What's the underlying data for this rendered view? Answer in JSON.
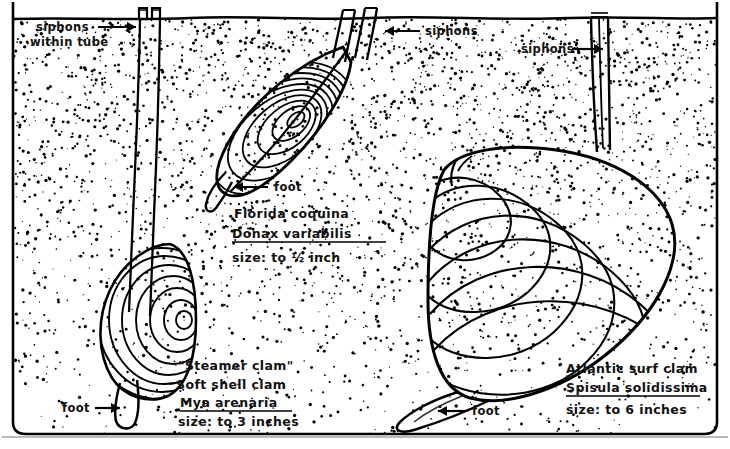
{
  "illustration": {
    "title": "Burrowing clams in sand — cross section",
    "medium": "pen-and-ink line drawing with stipple shading",
    "ink_color": "#000000",
    "background_color": "#ffffff"
  },
  "scene": {
    "sand_surface_label": "sand surface / water line",
    "sand_texture": "stipple dots, dense near surface, sparser at depth",
    "frame": "hand-drawn rounded rectangle border"
  },
  "annotations": [
    {
      "id": "siphons-within-tube",
      "text_line1": "siphons",
      "text_line2": "within tube",
      "arrow": "right",
      "x": 34,
      "y": 28
    },
    {
      "id": "siphons-coquina",
      "text_line1": "siphons",
      "text_line2": "",
      "arrow": "left",
      "x": 388,
      "y": 32
    },
    {
      "id": "siphons-surfclam",
      "text_line1": "siphons",
      "text_line2": "",
      "arrow": "right",
      "x": 521,
      "y": 50
    },
    {
      "id": "foot-coquina",
      "text_line1": "foot",
      "text_line2": "",
      "arrow": "left",
      "x": 274,
      "y": 188
    },
    {
      "id": "foot-softshell",
      "text_line1": "foot",
      "text_line2": "",
      "arrow": "right",
      "x": 64,
      "y": 409
    },
    {
      "id": "foot-surfclam",
      "text_line1": "foot",
      "text_line2": "",
      "arrow": "left",
      "x": 471,
      "y": 411
    }
  ],
  "specimens": [
    {
      "id": "coquina",
      "common_name": "Florida coquina",
      "scientific_name": "Donax variabilis",
      "scientific_name_underlined": true,
      "size_text": "size: to 1/2 inch",
      "size_value": "½",
      "size_unit": "inch",
      "label_x": 232,
      "label_y": 205,
      "growth_rings": 11,
      "siphon_count": 2,
      "depth": "shallow"
    },
    {
      "id": "soft-shell-clam",
      "common_name_quoted": "\"Steamer clam\"",
      "common_name": "Soft shell clam",
      "scientific_name": "Mya arenaria",
      "scientific_name_underlined": true,
      "size_text": "size: to 3 inches",
      "size_value": "3",
      "size_unit": "inches",
      "label_x": 176,
      "label_y": 357,
      "growth_rings": 9,
      "siphon_count": 2,
      "depth": "deep, siphons in tube"
    },
    {
      "id": "atlantic-surf-clam",
      "common_name": "Atlantic surf clam",
      "scientific_name": "Spisula solidissima",
      "scientific_name_underlined": true,
      "size_text": "size: to 6 inches",
      "size_value": "6",
      "size_unit": "inches",
      "label_x": 562,
      "label_y": 357,
      "growth_rings": 7,
      "siphon_count": 2,
      "depth": "shallow-moderate"
    }
  ],
  "label_blocks": {
    "coquina": [
      "Florida coquina",
      "Donax variabilis",
      "size: to ½ inch"
    ],
    "soft_shell": [
      "\"Steamer clam\"",
      "Soft shell clam",
      "Mya arenaria",
      "size: to 3 inches"
    ],
    "surf_clam": [
      "Atlantic surf clam",
      "Spisula solidissima",
      "size: to 6 inches"
    ]
  }
}
